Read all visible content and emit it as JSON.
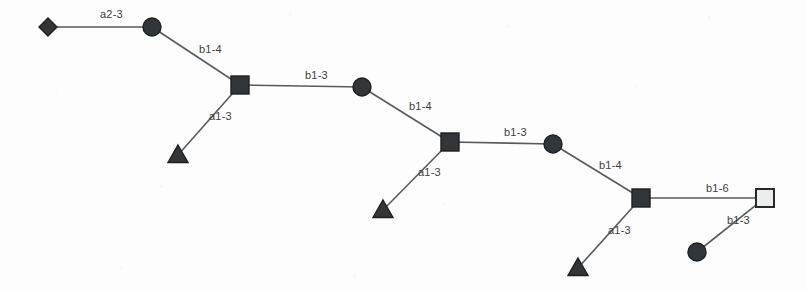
{
  "diagram": {
    "type": "glycan-symbol-nomenclature",
    "width": 806,
    "height": 291,
    "background_color": "#fdfdfd",
    "line_color": "#555a5e",
    "dark_node_color": "#333639",
    "light_node_color": "#eceeee",
    "node_border_color": "#1d1f21"
  },
  "nodes": [
    {
      "id": "n1",
      "shape": "diamond",
      "fill": "dark",
      "x": 48,
      "y": 27,
      "size": 9,
      "name": "diamond-node-1"
    },
    {
      "id": "n2",
      "shape": "circle",
      "fill": "dark",
      "x": 152,
      "y": 27,
      "size": 9,
      "name": "circle-node-1"
    },
    {
      "id": "n3",
      "shape": "square",
      "fill": "dark",
      "x": 240,
      "y": 85,
      "size": 9,
      "name": "square-node-1"
    },
    {
      "id": "n4",
      "shape": "triangle",
      "fill": "dark",
      "x": 178,
      "y": 155,
      "size": 10,
      "name": "triangle-node-1"
    },
    {
      "id": "n5",
      "shape": "circle",
      "fill": "dark",
      "x": 362,
      "y": 87,
      "size": 9,
      "name": "circle-node-2"
    },
    {
      "id": "n6",
      "shape": "square",
      "fill": "dark",
      "x": 450,
      "y": 142,
      "size": 9,
      "name": "square-node-2"
    },
    {
      "id": "n7",
      "shape": "triangle",
      "fill": "dark",
      "x": 383,
      "y": 210,
      "size": 10,
      "name": "triangle-node-2"
    },
    {
      "id": "n8",
      "shape": "circle",
      "fill": "dark",
      "x": 553,
      "y": 144,
      "size": 9,
      "name": "circle-node-3"
    },
    {
      "id": "n9",
      "shape": "square",
      "fill": "dark",
      "x": 641,
      "y": 198,
      "size": 9,
      "name": "square-node-3"
    },
    {
      "id": "n10",
      "shape": "triangle",
      "fill": "dark",
      "x": 578,
      "y": 268,
      "size": 10,
      "name": "triangle-node-3"
    },
    {
      "id": "n11",
      "shape": "square",
      "fill": "light",
      "x": 765,
      "y": 198,
      "size": 9,
      "name": "square-node-4"
    },
    {
      "id": "n12",
      "shape": "circle",
      "fill": "dark",
      "x": 697,
      "y": 252,
      "size": 9,
      "name": "circle-node-4"
    }
  ],
  "edges": [
    {
      "id": "e1",
      "from": "n1",
      "to": "n2",
      "label": "a2-3",
      "label_x": 100,
      "label_y": 18,
      "name": "edge-diamond1-circle1"
    },
    {
      "id": "e2",
      "from": "n2",
      "to": "n3",
      "label": "b1-4",
      "label_x": 199,
      "label_y": 53,
      "name": "edge-circle1-square1"
    },
    {
      "id": "e3",
      "from": "n3",
      "to": "n4",
      "label": "a1-3",
      "label_x": 209,
      "label_y": 120,
      "name": "edge-square1-triangle1"
    },
    {
      "id": "e4",
      "from": "n3",
      "to": "n5",
      "label": "b1-3",
      "label_x": 305,
      "label_y": 79,
      "name": "edge-square1-circle2"
    },
    {
      "id": "e5",
      "from": "n5",
      "to": "n6",
      "label": "b1-4",
      "label_x": 409,
      "label_y": 110,
      "name": "edge-circle2-square2"
    },
    {
      "id": "e6",
      "from": "n6",
      "to": "n7",
      "label": "a1-3",
      "label_x": 418,
      "label_y": 176,
      "name": "edge-square2-triangle2"
    },
    {
      "id": "e7",
      "from": "n6",
      "to": "n8",
      "label": "b1-3",
      "label_x": 504,
      "label_y": 136,
      "name": "edge-square2-circle3"
    },
    {
      "id": "e8",
      "from": "n8",
      "to": "n9",
      "label": "b1-4",
      "label_x": 599,
      "label_y": 169,
      "name": "edge-circle3-square3"
    },
    {
      "id": "e9",
      "from": "n9",
      "to": "n10",
      "label": "a1-3",
      "label_x": 608,
      "label_y": 234,
      "name": "edge-square3-triangle3"
    },
    {
      "id": "e10",
      "from": "n9",
      "to": "n11",
      "label": "b1-6",
      "label_x": 706,
      "label_y": 192,
      "name": "edge-square3-square4"
    },
    {
      "id": "e11",
      "from": "n11",
      "to": "n12",
      "label": "b1-3",
      "label_x": 727,
      "label_y": 224,
      "name": "edge-square4-circle4"
    }
  ]
}
